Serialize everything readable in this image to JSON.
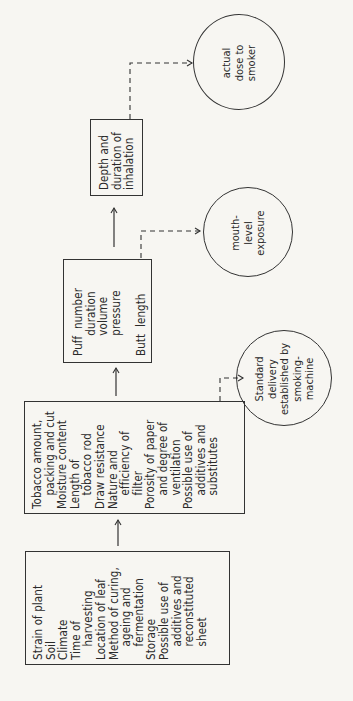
{
  "diagram": {
    "boxes": [
      {
        "id": "leaf-factors",
        "lines": [
          "Strain of plant",
          "Soil",
          "Climate",
          "Time of",
          "    harvesting",
          "Location of leaf",
          "Method of curing,",
          "    ageing and",
          "    fermentation",
          "Storage",
          "Possible use of",
          "    additives and",
          "    reconstituted",
          "    sheet"
        ]
      },
      {
        "id": "cigarette-factors",
        "lines": [
          "Tobacco amount,",
          "    packing and cut",
          "Moisture content",
          "Length of",
          "    tobacco rod",
          "Draw resistance",
          "Nature and",
          "    efficiency of",
          "    filter",
          "Porosity of paper",
          "    and degree of",
          "    ventilation",
          "Possible use of",
          "    additives and",
          "    substitutes"
        ]
      },
      {
        "id": "puff-factors",
        "lines": [
          "Puff  number",
          "      duration",
          "      volume",
          "      pressure",
          "",
          "Butt  length"
        ]
      },
      {
        "id": "inhalation-factors",
        "lines": [
          "Depth and",
          "duration of",
          "inhalation"
        ]
      }
    ],
    "circles": [
      {
        "id": "standard-delivery",
        "lines": [
          "Standard",
          "delivery",
          "established by",
          "smoking-",
          "machine"
        ]
      },
      {
        "id": "mouth-level-exposure",
        "lines": [
          "mouth-",
          "level",
          "exposure"
        ]
      },
      {
        "id": "actual-dose",
        "lines": [
          "actual",
          "dose to",
          "smoker"
        ]
      }
    ]
  }
}
